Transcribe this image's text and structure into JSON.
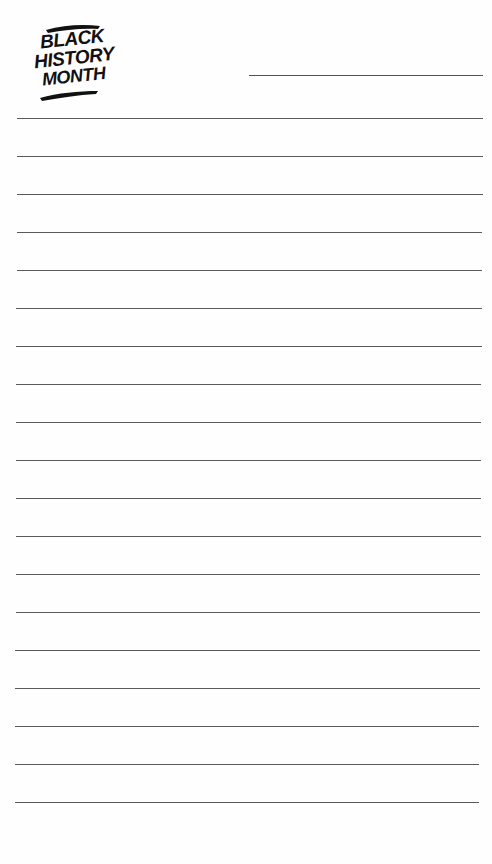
{
  "logo": {
    "lines": [
      "BLACK",
      "HISTORY",
      "MONTH"
    ]
  },
  "header": {
    "name_line": ""
  },
  "ruled_lines": {
    "count": 19,
    "first_y": 118,
    "spacing": 38,
    "color": "#5a5a5a"
  }
}
